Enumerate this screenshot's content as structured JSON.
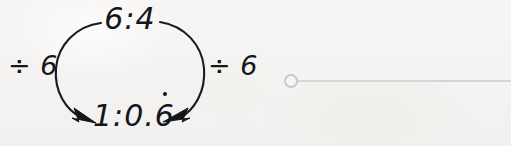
{
  "canvas": {
    "width": 511,
    "height": 146,
    "background_color": "#f6f5f3"
  },
  "diagram": {
    "type": "ratio-simplification-cycle",
    "top_label": "6:4",
    "bottom_label": {
      "prefix": "1:0.",
      "recurring_digit": "6",
      "full_text": "1:0.6̇"
    },
    "left_operation": "÷ 6",
    "right_operation": "÷ 6",
    "ink_color": "#15161a",
    "arrow_direction": "both arcs point downward to the bottom label"
  },
  "annotation": {
    "type": "line-with-handle",
    "handle_shape": "open-circle",
    "handle_color": "#c8c8c8",
    "line_color": "#cccccc",
    "line_start_x": 291,
    "line_end_x": 511,
    "line_y": 81
  }
}
